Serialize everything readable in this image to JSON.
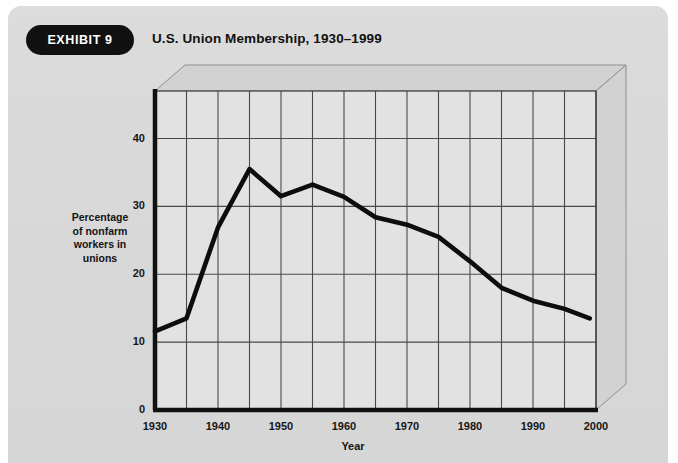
{
  "card": {
    "badge_label": "EXHIBIT 9",
    "title": "U.S. Union Membership, 1930–1999"
  },
  "colors": {
    "card_background": "#d9d9d9",
    "plot_background": "#e2e2e2",
    "plot_top_face": "#d2d2d2",
    "plot_side_face": "#d2d2d2",
    "axis_line": "#111111",
    "gridline": "#4a4a4a",
    "data_line": "#0d0d0d",
    "badge_background": "#111111",
    "badge_text": "#ffffff",
    "text": "#141414"
  },
  "chart_data": {
    "type": "line",
    "title": "U.S. Union Membership, 1930–1999",
    "xlabel": "Year",
    "ylabel": "Percentage of nonfarm workers in unions",
    "ylabel_lines": [
      "Percentage",
      "of nonfarm",
      "workers in",
      "unions"
    ],
    "xlim": [
      1930,
      2000
    ],
    "ylim": [
      0,
      47
    ],
    "xticks": [
      1930,
      1940,
      1950,
      1960,
      1970,
      1980,
      1990,
      2000
    ],
    "xtick_labels": [
      "1930",
      "1940",
      "1950",
      "1960",
      "1970",
      "1980",
      "1990",
      "2000"
    ],
    "yticks": [
      0,
      10,
      20,
      30,
      40
    ],
    "ytick_labels": [
      "0",
      "10",
      "20",
      "30",
      "40"
    ],
    "gridlines_x": [
      1930,
      1935,
      1940,
      1945,
      1950,
      1955,
      1960,
      1965,
      1970,
      1975,
      1980,
      1985,
      1990,
      1995,
      2000
    ],
    "gridlines_y": [
      10,
      20,
      30,
      40
    ],
    "grid": true,
    "legend": null,
    "series": [
      {
        "name": "Percentage of nonfarm workers in unions",
        "x": [
          1930,
          1935,
          1940,
          1945,
          1950,
          1955,
          1960,
          1965,
          1970,
          1975,
          1980,
          1985,
          1990,
          1995,
          1999
        ],
        "values": [
          11.6,
          13.5,
          26.9,
          35.5,
          31.5,
          33.2,
          31.4,
          28.4,
          27.3,
          25.5,
          21.9,
          18.0,
          16.1,
          14.9,
          13.5
        ]
      }
    ]
  }
}
